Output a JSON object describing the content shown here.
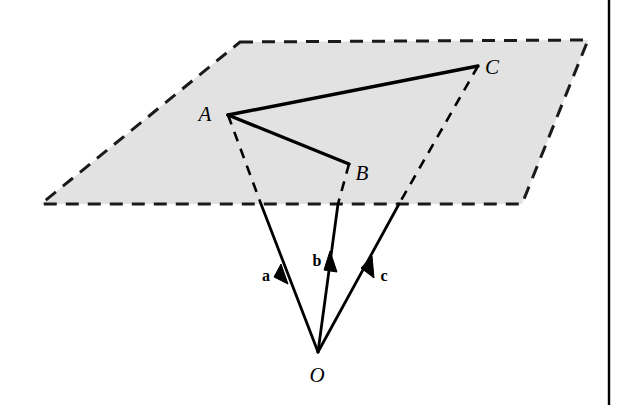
{
  "figure": {
    "background_color": "#ffffff",
    "plane_fill_color": "#e2e2e2",
    "plane_stroke_color": "#1a1a1a",
    "line_color": "#000000",
    "border_color": "#000000"
  },
  "labels": {
    "point_a": "A",
    "point_b": "B",
    "point_c": "C",
    "origin": "O",
    "vector_a": "a",
    "vector_b": "b",
    "vector_c": "c"
  },
  "geometry": {
    "plane_corners": [
      {
        "name": "top-left",
        "x": 240,
        "y": 42
      },
      {
        "name": "top-right",
        "x": 588,
        "y": 40
      },
      {
        "name": "bottom-right",
        "x": 522,
        "y": 204
      },
      {
        "name": "bottom-left",
        "x": 41,
        "y": 204
      }
    ],
    "points": [
      {
        "name": "A",
        "x": 228,
        "y": 115
      },
      {
        "name": "B",
        "x": 349,
        "y": 164
      },
      {
        "name": "C",
        "x": 478,
        "y": 66
      },
      {
        "name": "O",
        "x": 318,
        "y": 352
      }
    ],
    "plane_edge_crossings": [
      {
        "vector": "a",
        "x": 261,
        "y": 204
      },
      {
        "vector": "b",
        "x": 338,
        "y": 204
      },
      {
        "vector": "c",
        "x": 399,
        "y": 204
      }
    ],
    "solid_segments": [
      {
        "name": "A-C",
        "from": "A",
        "to": "C"
      },
      {
        "name": "A-B",
        "from": "A",
        "to": "B"
      }
    ],
    "arrowheads": [
      {
        "vector": "a",
        "x": 286,
        "y": 271
      },
      {
        "vector": "b",
        "x": 331,
        "y": 263
      },
      {
        "vector": "c",
        "x": 368,
        "y": 264
      }
    ],
    "label_positions": [
      {
        "text": "A",
        "x": 205,
        "y": 121
      },
      {
        "text": "B",
        "x": 358,
        "y": 178
      },
      {
        "text": "C",
        "x": 487,
        "y": 72
      },
      {
        "text": "O",
        "x": 311,
        "y": 381
      },
      {
        "text": "a",
        "x": 263,
        "y": 279
      },
      {
        "text": "b",
        "x": 316,
        "y": 263
      },
      {
        "text": "c",
        "x": 380,
        "y": 279
      }
    ],
    "frame_border": {
      "x": 609,
      "y_top": 0,
      "y_bottom": 405
    }
  }
}
